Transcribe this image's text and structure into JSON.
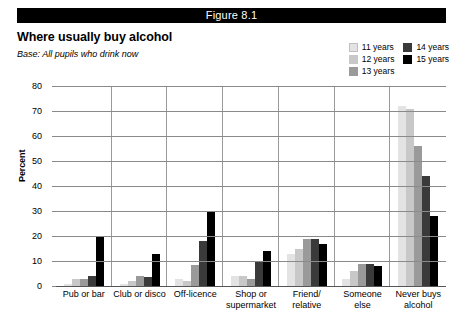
{
  "figure": {
    "number_label": "Figure 8.1",
    "title": "Where usually buy alcohol",
    "base_note": "Base: All pupils who drink now"
  },
  "legend": {
    "entries": [
      {
        "label": "11 years",
        "color": "#e3e3e3"
      },
      {
        "label": "12 years",
        "color": "#c8c8c8"
      },
      {
        "label": "13 years",
        "color": "#9a9a9a"
      },
      {
        "label": "14 years",
        "color": "#3a3a3a"
      },
      {
        "label": "15 years",
        "color": "#000000"
      }
    ]
  },
  "chart_data": {
    "type": "bar",
    "title": "Where usually buy alcohol",
    "subtitle": "Base: All pupils who drink now",
    "xlabel": "",
    "ylabel": "Percent",
    "ylim": [
      0,
      80
    ],
    "yticks": [
      0,
      10,
      20,
      30,
      40,
      50,
      60,
      70,
      80
    ],
    "grid": true,
    "legend_position": "top-right",
    "categories": [
      "Pub or bar",
      "Club or disco",
      "Off-licence",
      "Shop or supermarket",
      "Friend/ relative",
      "Someone else",
      "Never buys alcohol"
    ],
    "series": [
      {
        "name": "11 years",
        "color": "#e3e3e3",
        "values": [
          1,
          1,
          3,
          4,
          13,
          3,
          72
        ]
      },
      {
        "name": "12 years",
        "color": "#c8c8c8",
        "values": [
          3,
          2,
          2,
          4,
          15,
          6,
          71
        ]
      },
      {
        "name": "13 years",
        "color": "#9a9a9a",
        "values": [
          3,
          4,
          8.5,
          3,
          19,
          9,
          56
        ]
      },
      {
        "name": "14 years",
        "color": "#3a3a3a",
        "values": [
          4,
          3.5,
          18,
          9.5,
          19,
          9,
          44
        ]
      },
      {
        "name": "15 years",
        "color": "#000000",
        "values": [
          20,
          13,
          30,
          14,
          17,
          8,
          28
        ]
      }
    ]
  }
}
